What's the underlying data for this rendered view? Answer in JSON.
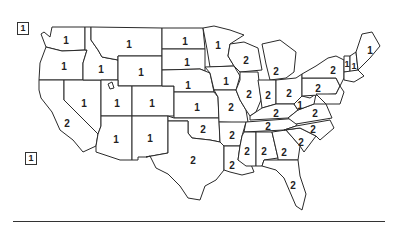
{
  "map": {
    "title": "",
    "insets": [
      {
        "region": "Alaska",
        "label": "1"
      },
      {
        "region": "Hawaii",
        "label": "1"
      }
    ],
    "states": [
      {
        "name": "Washington",
        "label": "1"
      },
      {
        "name": "Oregon",
        "label": "1"
      },
      {
        "name": "California",
        "label": "2"
      },
      {
        "name": "Idaho",
        "label": "1"
      },
      {
        "name": "Nevada",
        "label": "1"
      },
      {
        "name": "Montana",
        "label": "1"
      },
      {
        "name": "Wyoming",
        "label": "1"
      },
      {
        "name": "Utah",
        "label": "1"
      },
      {
        "name": "Colorado",
        "label": "1"
      },
      {
        "name": "Arizona",
        "label": "1"
      },
      {
        "name": "New Mexico",
        "label": "1"
      },
      {
        "name": "North Dakota",
        "label": "1"
      },
      {
        "name": "South Dakota",
        "label": "1"
      },
      {
        "name": "Nebraska",
        "label": "1"
      },
      {
        "name": "Kansas",
        "label": "1"
      },
      {
        "name": "Oklahoma",
        "label": "2"
      },
      {
        "name": "Texas",
        "label": "2"
      },
      {
        "name": "Minnesota",
        "label": "1"
      },
      {
        "name": "Iowa",
        "label": "1"
      },
      {
        "name": "Missouri",
        "label": "2"
      },
      {
        "name": "Arkansas",
        "label": "2"
      },
      {
        "name": "Louisiana",
        "label": "2"
      },
      {
        "name": "Wisconsin",
        "label": "2"
      },
      {
        "name": "Illinois",
        "label": "2"
      },
      {
        "name": "Michigan",
        "label": "2"
      },
      {
        "name": "Indiana",
        "label": "2"
      },
      {
        "name": "Ohio",
        "label": "2"
      },
      {
        "name": "Kentucky",
        "label": "2"
      },
      {
        "name": "Tennessee",
        "label": "2"
      },
      {
        "name": "Mississippi",
        "label": "2"
      },
      {
        "name": "Alabama",
        "label": "2"
      },
      {
        "name": "Georgia",
        "label": "2"
      },
      {
        "name": "Florida",
        "label": "2"
      },
      {
        "name": "South Carolina",
        "label": "2"
      },
      {
        "name": "North Carolina",
        "label": "2"
      },
      {
        "name": "Virginia",
        "label": "2"
      },
      {
        "name": "West Virginia",
        "label": "1"
      },
      {
        "name": "Pennsylvania",
        "label": "2"
      },
      {
        "name": "New York",
        "label": "2"
      },
      {
        "name": "Vermont",
        "label": "1"
      },
      {
        "name": "New Hampshire",
        "label": "1"
      },
      {
        "name": "Maine",
        "label": "1"
      }
    ]
  }
}
